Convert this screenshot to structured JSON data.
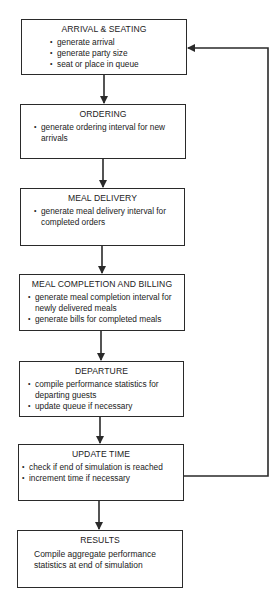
{
  "diagram": {
    "nodes": [
      {
        "id": "arrival",
        "title": "ARRIVAL & SEATING",
        "bullets": [
          "generate arrival",
          "generate party size",
          "seat or place in queue"
        ]
      },
      {
        "id": "ordering",
        "title": "ORDERING",
        "bullets": [
          "generate ordering interval for new arrivals"
        ]
      },
      {
        "id": "meal-delivery",
        "title": "MEAL DELIVERY",
        "bullets": [
          "generate meal delivery interval for completed orders"
        ]
      },
      {
        "id": "meal-completion",
        "title": "MEAL COMPLETION AND BILLING",
        "bullets": [
          "generate meal completion interval for newly delivered meals",
          "generate bills for completed meals"
        ]
      },
      {
        "id": "departure",
        "title": "DEPARTURE",
        "bullets": [
          "compile performance statistics for departing guests",
          "update queue if necessary"
        ]
      },
      {
        "id": "update-time",
        "title": "UPDATE TIME",
        "bullets": [
          "check if end of simulation is reached",
          "increment time if necessary"
        ]
      },
      {
        "id": "results",
        "title": "RESULTS",
        "description": "Compile aggregate performance statistics at end of simulation"
      }
    ],
    "edges": [
      {
        "from": "arrival",
        "to": "ordering"
      },
      {
        "from": "ordering",
        "to": "meal-delivery"
      },
      {
        "from": "meal-delivery",
        "to": "meal-completion"
      },
      {
        "from": "meal-completion",
        "to": "departure"
      },
      {
        "from": "departure",
        "to": "update-time"
      },
      {
        "from": "update-time",
        "to": "results"
      },
      {
        "from": "update-time",
        "to": "arrival",
        "type": "feedback-loop"
      }
    ],
    "colors": {
      "line": "#2a2a2a",
      "background": "#ffffff",
      "text": "#222222"
    }
  }
}
